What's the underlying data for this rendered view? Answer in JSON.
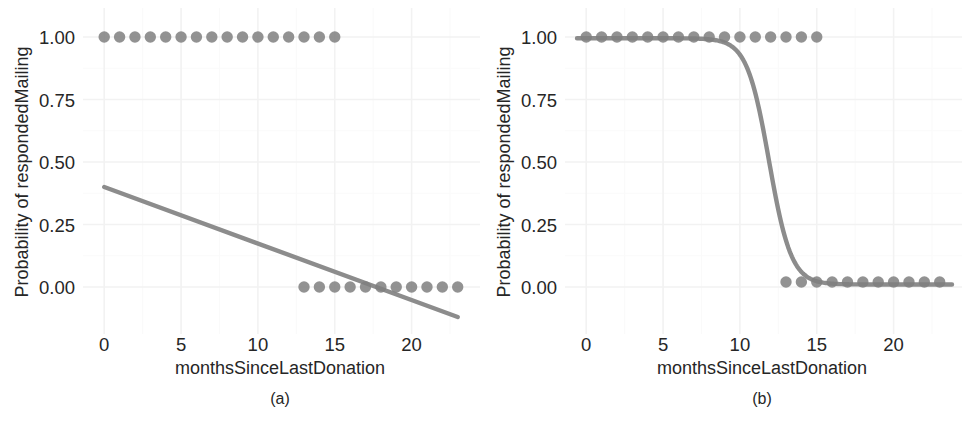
{
  "figure": {
    "panels": [
      {
        "id": "a",
        "letter": "(a)",
        "xlabel": "monthsSinceLastDonation",
        "ylabel": "Probability of respondedMailing"
      },
      {
        "id": "b",
        "letter": "(b)",
        "xlabel": "monthsSinceLastDonation",
        "ylabel": "Probability of respondedMailing"
      }
    ],
    "caption_bleed": "Figure continued below the visible crop"
  },
  "style": {
    "point_color": "#7f7f7f",
    "line_color": "#8c8c8c",
    "grid_color": "#f2f2f2",
    "background": "#ffffff",
    "text_color": "#262626"
  },
  "chart_data": [
    {
      "type": "scatter",
      "id": "a",
      "title": "(a)",
      "subtitle": "Linear (least squares) fit of respondedMailing on monthsSinceLastDonation",
      "xlabel": "monthsSinceLastDonation",
      "ylabel": "Probability of respondedMailing",
      "xlim": [
        -0.6,
        23.8
      ],
      "ylim": [
        -0.14,
        1.06
      ],
      "xticks": [
        0,
        5,
        10,
        15,
        20
      ],
      "xticklabels": [
        "0",
        "5",
        "10",
        "15",
        "20"
      ],
      "yticks": [
        0.0,
        0.25,
        0.5,
        0.75,
        1.0
      ],
      "yticklabels": [
        "0.00",
        "0.25",
        "0.50",
        "0.75",
        "1.00"
      ],
      "grid": true,
      "legend": "none",
      "series": [
        {
          "name": "observations",
          "marker": "filled-circle",
          "x": [
            0,
            1,
            2,
            3,
            4,
            5,
            6,
            7,
            8,
            9,
            10,
            11,
            12,
            13,
            14,
            15,
            13,
            14,
            15,
            16,
            17,
            18,
            19,
            20,
            21,
            22,
            23
          ],
          "y": [
            1,
            1,
            1,
            1,
            1,
            1,
            1,
            1,
            1,
            1,
            1,
            1,
            1,
            1,
            1,
            1,
            0,
            0,
            0,
            0,
            0,
            0,
            0,
            0,
            0,
            0,
            0
          ]
        },
        {
          "name": "linear fit",
          "type": "line",
          "intercept": 0.4,
          "slope": -0.0226,
          "x": [
            0,
            23
          ],
          "y": [
            0.4,
            -0.12
          ]
        }
      ]
    },
    {
      "type": "scatter",
      "id": "b",
      "title": "(b)",
      "subtitle": "Logistic regression fit of respondedMailing on monthsSinceLastDonation",
      "xlabel": "monthsSinceLastDonation",
      "ylabel": "Probability of respondedMailing",
      "xlim": [
        -0.6,
        23.8
      ],
      "ylim": [
        -0.14,
        1.06
      ],
      "xticks": [
        0,
        5,
        10,
        15,
        20
      ],
      "xticklabels": [
        "0",
        "5",
        "10",
        "15",
        "20"
      ],
      "yticks": [
        0.0,
        0.25,
        0.5,
        0.75,
        1.0
      ],
      "yticklabels": [
        "0.00",
        "0.25",
        "0.50",
        "0.75",
        "1.00"
      ],
      "grid": true,
      "legend": "none",
      "series": [
        {
          "name": "observations",
          "marker": "filled-circle",
          "x": [
            0,
            1,
            2,
            3,
            4,
            5,
            6,
            7,
            8,
            9,
            10,
            11,
            12,
            13,
            14,
            15,
            13,
            14,
            15,
            16,
            17,
            18,
            19,
            20,
            21,
            22,
            23
          ],
          "y": [
            1,
            1,
            1,
            1,
            1,
            1,
            1,
            1,
            1,
            1,
            1,
            1,
            1,
            1,
            1,
            1,
            0.02,
            0.02,
            0.02,
            0.02,
            0.02,
            0.02,
            0.02,
            0.02,
            0.02,
            0.02,
            0.02
          ]
        },
        {
          "name": "logistic fit",
          "type": "logistic",
          "midpoint": 11.9,
          "scale": 0.72,
          "asymptote_low": 0.01,
          "asymptote_high": 0.995
        }
      ]
    }
  ]
}
